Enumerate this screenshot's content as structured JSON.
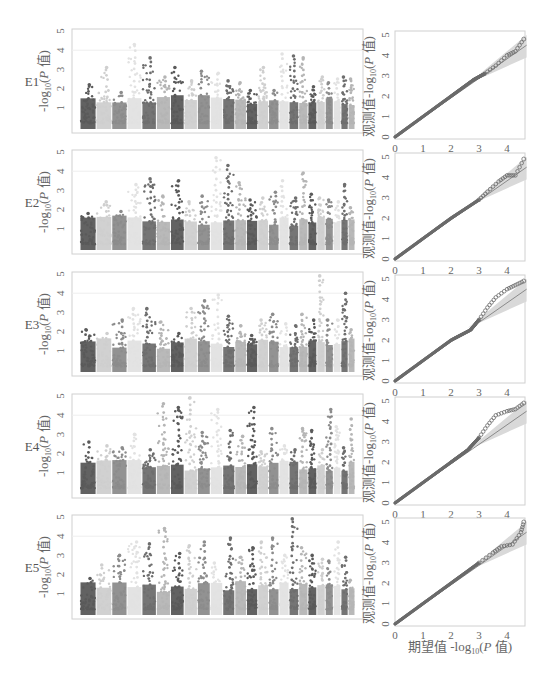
{
  "figure": {
    "rows": [
      "E1",
      "E2",
      "E3",
      "E4",
      "E5"
    ],
    "manhattan_ylabel": "-log10(P 值)",
    "qq_ylabel_observed": "观测值",
    "qq_ylabel_stat": "-log10(P 值)",
    "qq_xlabel_expected": "期望值",
    "qq_xlabel_stat": "-log10(P 值)",
    "colors": {
      "chrom_shades": [
        "#5a5a5a",
        "#cfcfcf",
        "#8c8c8c",
        "#e2e2e2",
        "#6e6e6e",
        "#b5b5b5"
      ],
      "qq_points": "#6b6b6b",
      "qq_line": "#8a8a8a",
      "qq_band": "#d9d9d9",
      "frame": "#d0d0d0",
      "threshold_line": "#eeeeee"
    }
  },
  "chart_data": [
    {
      "type": "scatter",
      "title": "E1 Manhattan",
      "ylabel": "-log10(P 值)",
      "yticks": [
        1,
        2,
        3,
        4,
        5
      ],
      "ylim": [
        0,
        5
      ],
      "chromosomes": 24,
      "peaks": [
        2.2,
        3.1,
        1.8,
        4.3,
        3.6,
        2.6,
        3.1,
        2.4,
        2.9,
        2.8,
        2.4,
        2.3,
        1.9,
        3.1,
        1.9,
        3.8,
        3.7,
        3.6,
        2.1,
        2.6,
        2.3,
        2.5,
        2.6,
        2.5
      ]
    },
    {
      "type": "scatter",
      "title": "E2 Manhattan",
      "ylabel": "-log10(P 值)",
      "yticks": [
        1,
        2,
        3,
        4,
        5
      ],
      "ylim": [
        0,
        5
      ],
      "chromosomes": 24,
      "peaks": [
        1.8,
        2.4,
        1.9,
        3.3,
        3.6,
        2.7,
        3.5,
        2.4,
        2.7,
        4.7,
        4.3,
        3.4,
        2.5,
        2.6,
        2.9,
        3.5,
        2.6,
        3.9,
        2.8,
        2.6,
        2.5,
        2.4,
        3.3,
        2.1
      ]
    },
    {
      "type": "scatter",
      "title": "E3 Manhattan",
      "ylabel": "-log10(P 值)",
      "yticks": [
        1,
        2,
        3,
        4,
        5
      ],
      "ylim": [
        0,
        5
      ],
      "chromosomes": 24,
      "peaks": [
        2.1,
        1.9,
        2.6,
        3.2,
        3.2,
        2.5,
        1.9,
        3.2,
        3.6,
        3.9,
        2.8,
        2.3,
        1.8,
        2.6,
        2.9,
        2.4,
        2.3,
        2.9,
        2.6,
        4.9,
        2.6,
        2.6,
        4.0,
        2.1
      ]
    },
    {
      "type": "scatter",
      "title": "E4 Manhattan",
      "ylabel": "-log10(P 值)",
      "yticks": [
        1,
        2,
        3,
        4,
        5
      ],
      "ylim": [
        0,
        5
      ],
      "chromosomes": 24,
      "peaks": [
        2.6,
        2.4,
        2.3,
        3.0,
        2.2,
        4.6,
        4.4,
        4.9,
        3.1,
        4.3,
        3.2,
        2.9,
        4.4,
        2.1,
        3.3,
        2.4,
        2.2,
        3.3,
        3.2,
        2.2,
        4.3,
        3.4,
        2.3,
        3.8
      ]
    },
    {
      "type": "scatter",
      "title": "E5 Manhattan",
      "ylabel": "-log10(P 值)",
      "yticks": [
        1,
        2,
        3,
        4,
        5
      ],
      "ylim": [
        0,
        5
      ],
      "chromosomes": 24,
      "peaks": [
        1.8,
        2.5,
        3.0,
        3.7,
        3.6,
        4.4,
        3.1,
        3.5,
        3.7,
        2.6,
        3.9,
        2.9,
        3.4,
        3.7,
        3.9,
        3.0,
        4.9,
        3.4,
        3.0,
        2.8,
        2.7,
        3.7,
        2.9,
        1.7
      ]
    },
    {
      "type": "scatter",
      "title": "E1 QQ",
      "xlabel": "期望值 -log10(P 值)",
      "ylabel": "观测值 -log10(P 值)",
      "xticks": [
        0,
        1,
        2,
        3,
        4
      ],
      "yticks": [
        0,
        1,
        2,
        3,
        4,
        5
      ],
      "xlim": [
        0,
        4.7
      ],
      "ylim": [
        0,
        5
      ],
      "curve": [
        [
          0,
          0
        ],
        [
          1,
          1
        ],
        [
          2,
          2
        ],
        [
          2.8,
          2.8
        ],
        [
          3.2,
          3.1
        ],
        [
          3.6,
          3.5
        ],
        [
          4.0,
          4.0
        ],
        [
          4.3,
          4.2
        ],
        [
          4.6,
          4.8
        ]
      ]
    },
    {
      "type": "scatter",
      "title": "E2 QQ",
      "xlabel": "期望值 -log10(P 值)",
      "ylabel": "观测值 -log10(P 值)",
      "xticks": [
        0,
        1,
        2,
        3,
        4
      ],
      "yticks": [
        0,
        1,
        2,
        3,
        4,
        5
      ],
      "xlim": [
        0,
        4.7
      ],
      "ylim": [
        0,
        5
      ],
      "curve": [
        [
          0,
          0
        ],
        [
          1,
          1
        ],
        [
          2,
          2
        ],
        [
          3,
          2.9
        ],
        [
          3.3,
          3.3
        ],
        [
          3.7,
          3.8
        ],
        [
          4.0,
          4.1
        ],
        [
          4.3,
          4.1
        ],
        [
          4.6,
          4.9
        ]
      ]
    },
    {
      "type": "scatter",
      "title": "E3 QQ",
      "xlabel": "期望值 -log10(P 值)",
      "ylabel": "观测值 -log10(P 值)",
      "xticks": [
        0,
        1,
        2,
        3,
        4
      ],
      "yticks": [
        0,
        1,
        2,
        3,
        4,
        5
      ],
      "xlim": [
        0,
        4.7
      ],
      "ylim": [
        0,
        5
      ],
      "curve": [
        [
          0,
          0
        ],
        [
          1,
          1
        ],
        [
          2,
          2
        ],
        [
          2.7,
          2.5
        ],
        [
          3.0,
          3.0
        ],
        [
          3.3,
          3.6
        ],
        [
          3.6,
          4.1
        ],
        [
          4.0,
          4.5
        ],
        [
          4.3,
          4.7
        ],
        [
          4.6,
          4.9
        ]
      ]
    },
    {
      "type": "scatter",
      "title": "E4 QQ",
      "xlabel": "期望值 -log10(P 值)",
      "ylabel": "观测值 -log10(P 值)",
      "xticks": [
        0,
        1,
        2,
        3,
        4
      ],
      "yticks": [
        0,
        1,
        2,
        3,
        4,
        5
      ],
      "xlim": [
        0,
        4.7
      ],
      "ylim": [
        0,
        5
      ],
      "curve": [
        [
          0,
          0
        ],
        [
          1,
          1
        ],
        [
          2,
          2
        ],
        [
          2.6,
          2.6
        ],
        [
          3.0,
          3.2
        ],
        [
          3.3,
          3.8
        ],
        [
          3.6,
          4.3
        ],
        [
          4.0,
          4.5
        ],
        [
          4.3,
          4.6
        ],
        [
          4.6,
          4.9
        ]
      ]
    },
    {
      "type": "scatter",
      "title": "E5 QQ",
      "xlabel": "期望值 -log10(P 值)",
      "ylabel": "观测值 -log10(P 值)",
      "xticks": [
        0,
        1,
        2,
        3,
        4
      ],
      "yticks": [
        0,
        1,
        2,
        3,
        4,
        5
      ],
      "xlim": [
        0,
        4.7
      ],
      "ylim": [
        0,
        5
      ],
      "curve": [
        [
          0,
          0
        ],
        [
          1,
          1
        ],
        [
          2,
          2
        ],
        [
          3,
          3
        ],
        [
          3.5,
          3.5
        ],
        [
          3.8,
          3.8
        ],
        [
          4.2,
          3.9
        ],
        [
          4.5,
          4.5
        ],
        [
          4.6,
          5.0
        ]
      ]
    }
  ]
}
